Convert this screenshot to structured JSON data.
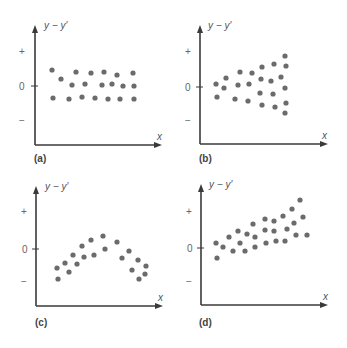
{
  "figure": {
    "y_axis_label": "y − y′",
    "x_axis_label": "x",
    "sign_plus": "+",
    "sign_zero": "0",
    "sign_minus": "−",
    "colors": {
      "axis": "#3a3a3a",
      "dot": "#6b6b6b",
      "text": "#555555"
    }
  },
  "chart_data": [
    {
      "type": "scatter",
      "panel_label": "(a)",
      "title": "",
      "xlabel": "x",
      "ylabel": "y − y′",
      "ytick_labels": [
        "+",
        "0",
        "−"
      ],
      "pattern": "horizontal band around 0 (random residuals)",
      "layout": {
        "ox": 35,
        "top": 25,
        "zero": 86,
        "plus": 51,
        "minus": 120,
        "bottom": 145,
        "right": 162
      },
      "points": [
        [
          52,
          70
        ],
        [
          61,
          79
        ],
        [
          76,
          72
        ],
        [
          91,
          73
        ],
        [
          104,
          72
        ],
        [
          117,
          75
        ],
        [
          133,
          73
        ],
        [
          72,
          85
        ],
        [
          85,
          84
        ],
        [
          102,
          85
        ],
        [
          112,
          84
        ],
        [
          123,
          86
        ],
        [
          134,
          86
        ],
        [
          53,
          98
        ],
        [
          69,
          99
        ],
        [
          82,
          97
        ],
        [
          95,
          98
        ],
        [
          108,
          99
        ],
        [
          120,
          99
        ],
        [
          134,
          99
        ]
      ]
    },
    {
      "type": "scatter",
      "panel_label": "(b)",
      "title": "",
      "xlabel": "x",
      "ylabel": "y − y′",
      "ytick_labels": [
        "+",
        "0",
        "−"
      ],
      "pattern": "funnel widening with x (increasing variance)",
      "layout": {
        "ox": 200,
        "top": 25,
        "zero": 87,
        "plus": 51,
        "minus": 120,
        "bottom": 144,
        "right": 328
      },
      "points": [
        [
          216,
          84
        ],
        [
          226,
          78
        ],
        [
          224,
          88
        ],
        [
          217,
          97
        ],
        [
          240,
          72
        ],
        [
          238,
          85
        ],
        [
          235,
          99
        ],
        [
          252,
          73
        ],
        [
          249,
          84
        ],
        [
          248,
          101
        ],
        [
          262,
          67
        ],
        [
          261,
          79
        ],
        [
          260,
          93
        ],
        [
          262,
          105
        ],
        [
          274,
          64
        ],
        [
          271,
          81
        ],
        [
          273,
          94
        ],
        [
          275,
          107
        ],
        [
          281,
          77
        ],
        [
          285,
          56
        ],
        [
          286,
          66
        ],
        [
          285,
          88
        ],
        [
          286,
          103
        ],
        [
          285,
          113
        ]
      ]
    },
    {
      "type": "scatter",
      "panel_label": "(c)",
      "title": "",
      "xlabel": "x",
      "ylabel": "y − y′",
      "ytick_labels": [
        "+",
        "0",
        "−"
      ],
      "pattern": "inverted U curve (nonlinear)",
      "layout": {
        "ox": 36,
        "top": 186,
        "zero": 249,
        "plus": 211,
        "minus": 281,
        "bottom": 306,
        "right": 163
      },
      "points": [
        [
          57,
          268
        ],
        [
          58,
          279
        ],
        [
          65,
          263
        ],
        [
          69,
          272
        ],
        [
          73,
          255
        ],
        [
          77,
          264
        ],
        [
          82,
          246
        ],
        [
          84,
          257
        ],
        [
          91,
          240
        ],
        [
          94,
          255
        ],
        [
          103,
          236
        ],
        [
          105,
          249
        ],
        [
          117,
          242
        ],
        [
          122,
          258
        ],
        [
          129,
          251
        ],
        [
          132,
          270
        ],
        [
          138,
          260
        ],
        [
          139,
          279
        ],
        [
          145,
          274
        ],
        [
          146,
          266
        ]
      ]
    },
    {
      "type": "scatter",
      "panel_label": "(d)",
      "title": "",
      "xlabel": "x",
      "ylabel": "y − y′",
      "ytick_labels": [
        "+",
        "0",
        "−"
      ],
      "pattern": "upward linear trend",
      "layout": {
        "ox": 201,
        "top": 184,
        "zero": 248,
        "plus": 211,
        "minus": 281,
        "bottom": 305,
        "right": 328
      },
      "points": [
        [
          216,
          243
        ],
        [
          217,
          258
        ],
        [
          223,
          247
        ],
        [
          229,
          237
        ],
        [
          233,
          251
        ],
        [
          238,
          231
        ],
        [
          240,
          243
        ],
        [
          245,
          251
        ],
        [
          247,
          234
        ],
        [
          253,
          224
        ],
        [
          255,
          237
        ],
        [
          255,
          247
        ],
        [
          265,
          219
        ],
        [
          265,
          230
        ],
        [
          266,
          243
        ],
        [
          274,
          221
        ],
        [
          274,
          231
        ],
        [
          276,
          241
        ],
        [
          283,
          216
        ],
        [
          287,
          229
        ],
        [
          285,
          241
        ],
        [
          292,
          209
        ],
        [
          294,
          223
        ],
        [
          296,
          235
        ],
        [
          300,
          200
        ],
        [
          303,
          217
        ],
        [
          307,
          235
        ]
      ]
    }
  ]
}
